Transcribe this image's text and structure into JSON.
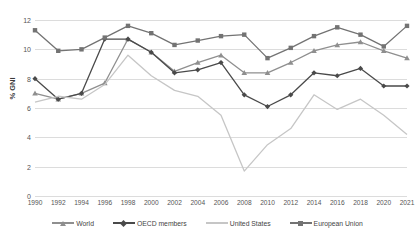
{
  "chart_data": {
    "type": "line",
    "title": "",
    "xlabel": "",
    "ylabel": "% GNI",
    "ylim": [
      0,
      12
    ],
    "ytick_step": 2,
    "grid": true,
    "legend_position": "bottom",
    "categories": [
      "1990",
      "1992",
      "1994",
      "1996",
      "1998",
      "2000",
      "2002",
      "2004",
      "2006",
      "2008",
      "2010",
      "2012",
      "2014",
      "2016",
      "2018",
      "2020",
      "2021"
    ],
    "yticks": [
      "0",
      "2",
      "4",
      "6",
      "8",
      "10",
      "12"
    ],
    "series": [
      {
        "name": "World",
        "color": "#8f8f8f",
        "marker": "triangle",
        "values": [
          7.0,
          6.6,
          7.0,
          7.7,
          10.7,
          9.8,
          8.5,
          9.1,
          9.6,
          8.4,
          8.4,
          9.1,
          9.9,
          10.3,
          10.5,
          9.9,
          9.4
        ]
      },
      {
        "name": "OECD members",
        "color": "#4a4a4a",
        "marker": "diamond",
        "values": [
          8.0,
          6.6,
          7.0,
          10.7,
          10.7,
          9.8,
          8.4,
          8.6,
          9.1,
          6.9,
          6.1,
          6.9,
          8.4,
          8.2,
          8.7,
          7.5,
          7.5
        ]
      },
      {
        "name": "United States",
        "color": "#c6c6c6",
        "marker": "none",
        "values": [
          6.4,
          6.8,
          6.6,
          7.6,
          9.6,
          8.2,
          7.2,
          6.8,
          5.5,
          1.7,
          3.5,
          4.6,
          6.9,
          5.9,
          6.6,
          5.5,
          4.2
        ]
      },
      {
        "name": "European Union",
        "color": "#737373",
        "marker": "square",
        "values": [
          11.3,
          9.9,
          10.0,
          10.8,
          11.6,
          11.1,
          10.3,
          10.6,
          10.9,
          11.0,
          9.4,
          10.1,
          10.9,
          11.5,
          11.0,
          10.2,
          11.6
        ]
      }
    ]
  }
}
